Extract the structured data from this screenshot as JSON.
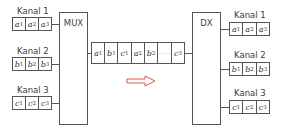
{
  "diagram": {
    "mux_label": "MUX",
    "demux_label": "DX",
    "input_channels": [
      {
        "label": "Kanal 1",
        "cells": [
          {
            "sym": "a",
            "sub": "1"
          },
          {
            "sym": "a",
            "sub": "2"
          },
          {
            "sym": "a",
            "sub": "3"
          }
        ]
      },
      {
        "label": "Kanal 2",
        "cells": [
          {
            "sym": "b",
            "sub": "1"
          },
          {
            "sym": "b",
            "sub": "2"
          },
          {
            "sym": "b",
            "sub": "3"
          }
        ]
      },
      {
        "label": "Kanal 3",
        "cells": [
          {
            "sym": "c",
            "sub": "1"
          },
          {
            "sym": "c",
            "sub": "2"
          },
          {
            "sym": "c",
            "sub": "3"
          }
        ]
      }
    ],
    "output_channels": [
      {
        "label": "Kanal 1",
        "cells": [
          {
            "sym": "a",
            "sub": "1"
          },
          {
            "sym": "a",
            "sub": "2"
          },
          {
            "sym": "a",
            "sub": "3"
          }
        ]
      },
      {
        "label": "Kanal 2",
        "cells": [
          {
            "sym": "b",
            "sub": "1"
          },
          {
            "sym": "b",
            "sub": "2"
          },
          {
            "sym": "b",
            "sub": "3"
          }
        ]
      },
      {
        "label": "Kanal 3",
        "cells": [
          {
            "sym": "c",
            "sub": "1"
          },
          {
            "sym": "c",
            "sub": "2"
          },
          {
            "sym": "c",
            "sub": "3"
          }
        ]
      }
    ],
    "multiplexed_stream": [
      {
        "sym": "a",
        "sub": "1"
      },
      {
        "sym": "b",
        "sub": "1"
      },
      {
        "sym": "c",
        "sub": "1"
      },
      {
        "sym": "a",
        "sub": "2"
      },
      {
        "sym": "b",
        "sub": "2"
      },
      {
        "sym": "",
        "sub": "",
        "dots": "·····"
      },
      {
        "sym": "c",
        "sub": "3"
      }
    ],
    "direction_arrow": "right-arrow",
    "colors": {
      "line": "#555555",
      "text": "#3a3a3a",
      "arrow": "#d9534f"
    }
  }
}
